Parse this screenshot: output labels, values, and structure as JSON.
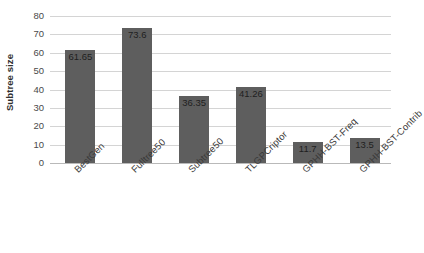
{
  "chart_data": {
    "type": "bar",
    "title": "",
    "xlabel": "",
    "ylabel": "Subtree size",
    "ylim": [
      0,
      80
    ],
    "ytick_step": 10,
    "yticks": [
      80,
      70,
      60,
      50,
      40,
      30,
      20,
      10,
      0
    ],
    "grid": true,
    "legend": "none",
    "bar_color": "#5e5e5e",
    "gridline_color": "#d4d4d4",
    "categories": [
      "BestGen",
      "Fulltree50",
      "Subtree50",
      "TLGPCriptor",
      "GPHH-BST-Freq",
      "GPHH-BST-Contrib"
    ],
    "values": [
      61.65,
      73.6,
      36.35,
      41.26,
      11.7,
      13.5
    ],
    "value_labels": [
      "61.65",
      "73.6",
      "36.35",
      "41.26",
      "11.7",
      "13.5"
    ]
  }
}
